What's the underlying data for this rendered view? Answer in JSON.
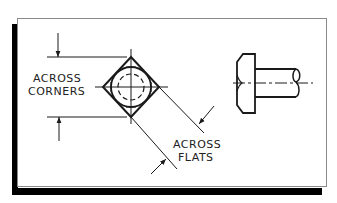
{
  "figure": {
    "labels": {
      "across_corners_line1": "ACROSS",
      "across_corners_line2": "CORNERS",
      "across_flats_line1": "ACROSS",
      "across_flats_line2": "FLATS"
    },
    "views": {
      "end_view": "square-head-end-view",
      "side_view": "bolt-side-view"
    },
    "colors": {
      "line": "#1a1a1a",
      "frame_border": "#8a8a8a",
      "shadow": "#000000",
      "background": "#ffffff"
    }
  }
}
